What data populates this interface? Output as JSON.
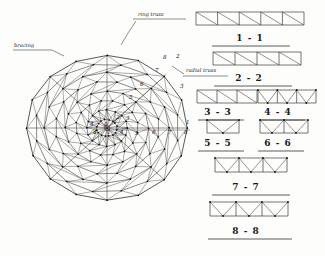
{
  "sheet": {
    "title": "Lamella dome framing plan with radial truss sections",
    "ink_color": "#2b2b2b",
    "paper_color": "#fdfdfb"
  },
  "plan": {
    "name": "dome-framing-plan",
    "annotations": [
      {
        "id": "ring-truss",
        "text": "ring truss",
        "x": 138,
        "y": 16
      },
      {
        "id": "radial-truss",
        "text": "radial truss",
        "x": 186,
        "y": 72
      },
      {
        "id": "bracing",
        "text": "bracing",
        "x": 14,
        "y": 47
      }
    ],
    "ring_numbers_horizontal": [
      "0",
      "1",
      "4",
      "5",
      "6",
      "7",
      "8"
    ],
    "ring_numbers_diagonal": [
      "2",
      "3",
      "5",
      "6",
      "7",
      "8"
    ],
    "center_label": "0",
    "ring_count": 8,
    "radial_sectors": 16,
    "node_labels": [
      {
        "text": "0",
        "x": 104,
        "y": 126
      },
      {
        "text": "1",
        "x": 107,
        "y": 134
      },
      {
        "text": "2",
        "x": 116,
        "y": 119
      },
      {
        "text": "3",
        "x": 126,
        "y": 120
      },
      {
        "text": "4",
        "x": 93,
        "y": 134
      },
      {
        "text": "4",
        "x": 120,
        "y": 134
      },
      {
        "text": "5",
        "x": 135,
        "y": 135
      },
      {
        "text": "6",
        "x": 152,
        "y": 134
      },
      {
        "text": "7",
        "x": 168,
        "y": 134
      },
      {
        "text": "8",
        "x": 184,
        "y": 134
      },
      {
        "text": "1",
        "x": 186,
        "y": 124
      },
      {
        "text": "3",
        "x": 180,
        "y": 88
      },
      {
        "text": "5",
        "x": 129,
        "y": 99
      },
      {
        "text": "6",
        "x": 140,
        "y": 86
      },
      {
        "text": "7",
        "x": 155,
        "y": 72
      },
      {
        "text": "8",
        "x": 163,
        "y": 59
      },
      {
        "text": "2",
        "x": 176,
        "y": 58
      },
      {
        "text": "4",
        "x": 90,
        "y": 126
      }
    ]
  },
  "sections": [
    {
      "id": "section-1-1",
      "label": "1 - 1",
      "bays": 5,
      "pattern": "pratt",
      "x": 196,
      "y": 12,
      "w": 108,
      "h": 13,
      "label_x": 250,
      "label_y": 41,
      "rule_x1": 212,
      "rule_x2": 290,
      "rule_y": 46
    },
    {
      "id": "section-2-2",
      "label": "2 - 2",
      "bays": 4,
      "pattern": "pratt",
      "x": 213,
      "y": 52,
      "w": 88,
      "h": 13,
      "label_x": 249,
      "label_y": 81,
      "rule_x1": 214,
      "rule_x2": 292,
      "rule_y": 86
    },
    {
      "id": "section-3-3",
      "label": "3 - 3",
      "bays": 3,
      "pattern": "pratt",
      "x": 197,
      "y": 90,
      "w": 60,
      "h": 13,
      "label_x": 218,
      "label_y": 115,
      "rule_x1": 198,
      "rule_x2": 244,
      "rule_y": 120
    },
    {
      "id": "section-4-4",
      "label": "4 - 4",
      "bays": 3,
      "pattern": "warren",
      "x": 258,
      "y": 90,
      "w": 58,
      "h": 13,
      "label_x": 278,
      "label_y": 115,
      "rule_x1": 259,
      "rule_x2": 305,
      "rule_y": 120
    },
    {
      "id": "section-5-5",
      "label": "5 - 5",
      "bays": 1,
      "pattern": "warren",
      "x": 207,
      "y": 120,
      "w": 32,
      "h": 13,
      "label_x": 218,
      "label_y": 146,
      "rule_x1": 198,
      "rule_x2": 244,
      "rule_y": 151
    },
    {
      "id": "section-6-6",
      "label": "6 - 6",
      "bays": 2,
      "pattern": "warren",
      "x": 260,
      "y": 120,
      "w": 48,
      "h": 13,
      "label_x": 278,
      "label_y": 146,
      "rule_x1": 258,
      "rule_x2": 304,
      "rule_y": 151
    },
    {
      "id": "section-7-7",
      "label": "7 - 7",
      "bays": 3,
      "pattern": "warren",
      "x": 215,
      "y": 158,
      "w": 72,
      "h": 14,
      "label_x": 246,
      "label_y": 190,
      "rule_x1": 212,
      "rule_x2": 290,
      "rule_y": 195
    },
    {
      "id": "section-8-8",
      "label": "8 - 8",
      "bays": 3,
      "pattern": "warren",
      "x": 210,
      "y": 202,
      "w": 78,
      "h": 14,
      "label_x": 246,
      "label_y": 234,
      "rule_x1": 208,
      "rule_x2": 292,
      "rule_y": 239
    }
  ]
}
